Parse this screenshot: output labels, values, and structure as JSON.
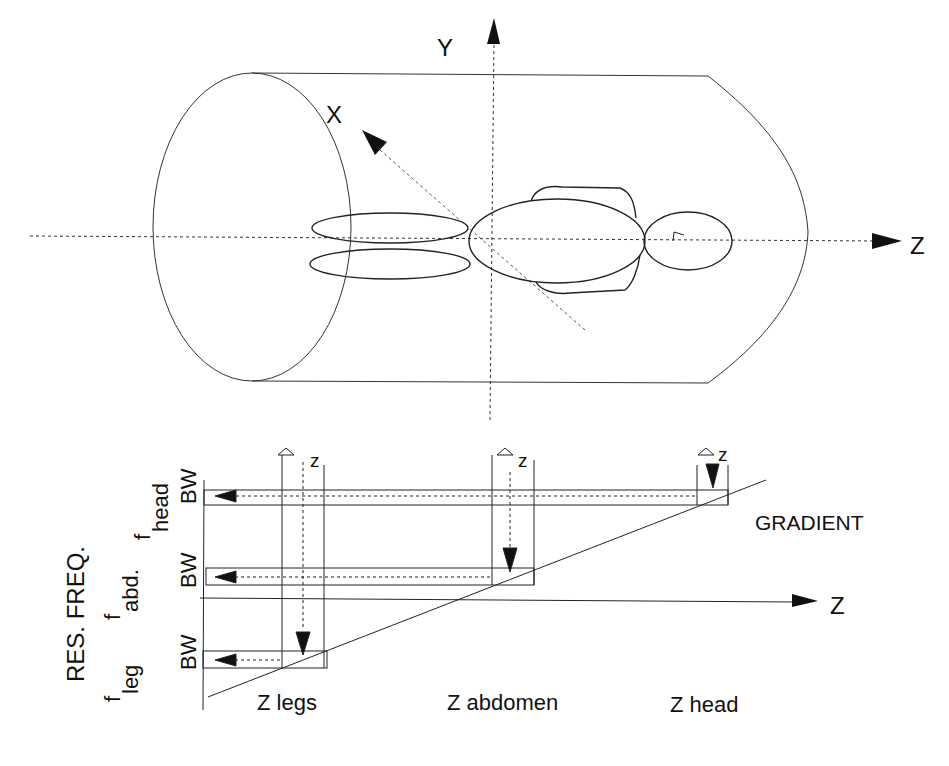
{
  "diagram": {
    "top_view": {
      "axes": {
        "y_label": "Y",
        "x_label": "X",
        "z_label": "Z"
      },
      "body_parts": [
        "legs",
        "abdomen",
        "head"
      ]
    },
    "bottom_plot": {
      "y_axis_label": "RES. FREQ.",
      "freq_labels": [
        {
          "main": "f",
          "sub": "head"
        },
        {
          "main": "f",
          "sub": "abd."
        },
        {
          "main": "f",
          "sub": "leg"
        }
      ],
      "bw_label": "BW",
      "delta_z_label": "z",
      "gradient_label": "GRADIENT",
      "z_axis_label": "Z",
      "position_labels": [
        "Z legs",
        "Z abdomen",
        "Z head"
      ]
    },
    "colors": {
      "line": "#222222",
      "background": "#ffffff"
    }
  }
}
